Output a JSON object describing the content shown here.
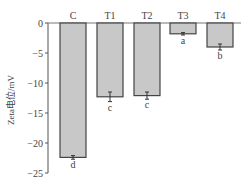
{
  "chart_data": {
    "type": "bar",
    "title": "",
    "xlabel": "",
    "ylabel": "Zeta电位/mV",
    "categories": [
      "C",
      "T1",
      "T2",
      "T3",
      "T4"
    ],
    "values": [
      -22.4,
      -12.3,
      -12.1,
      -1.8,
      -4.0
    ],
    "errors": [
      0.3,
      0.8,
      0.6,
      0.2,
      0.5
    ],
    "significance_letters": [
      "d",
      "c",
      "c",
      "a",
      "b"
    ],
    "ylim": [
      -25,
      0
    ],
    "yticks": [
      0,
      -5,
      -10,
      -15,
      -20,
      -25
    ],
    "ytick_labels": [
      "0",
      "−5",
      "−10",
      "−15",
      "−20",
      "−25"
    ],
    "grid": false,
    "legend": null,
    "colors": {
      "bar_fill": "#c8c8c8",
      "bar_edge": "#444444",
      "axis": "#555555"
    }
  }
}
